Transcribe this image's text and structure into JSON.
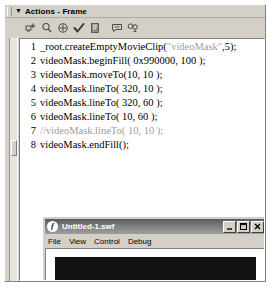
{
  "panel": {
    "title": "Actions - Frame",
    "collapse_arrow": "▼",
    "grip_icon": "drag-grip-icon"
  },
  "toolbar": {
    "buttons": [
      {
        "name": "add-statement-icon",
        "label": "Add a new item to the script"
      },
      {
        "name": "find-icon",
        "label": "Find"
      },
      {
        "name": "insert-target-path-icon",
        "label": "Insert a target path"
      },
      {
        "name": "check-syntax-icon",
        "label": "Check syntax"
      },
      {
        "name": "auto-format-icon",
        "label": "Auto format"
      },
      {
        "name": "show-code-hint-icon",
        "label": "Show code hint"
      },
      {
        "name": "debug-options-icon",
        "label": "Debug options"
      }
    ]
  },
  "code": {
    "lines": [
      {
        "number": "1",
        "bold": false,
        "tokens": [
          {
            "text": "_root.createEmptyMovieClip(",
            "type": "plain"
          },
          {
            "text": "\"videoMask\"",
            "type": "string"
          },
          {
            "text": ",5);",
            "type": "plain"
          }
        ]
      },
      {
        "number": "2",
        "bold": true,
        "tokens": [
          {
            "text": "videoMask.beginFill( 0x990000, 100 );",
            "type": "plain"
          }
        ]
      },
      {
        "number": "3",
        "bold": true,
        "tokens": [
          {
            "text": "videoMask.moveTo(10, 10 );",
            "type": "plain"
          }
        ]
      },
      {
        "number": "4",
        "bold": true,
        "tokens": [
          {
            "text": "videoMask.lineTo( 320, 10 );",
            "type": "plain"
          }
        ]
      },
      {
        "number": "5",
        "bold": true,
        "tokens": [
          {
            "text": "videoMask.lineTo( 320, 60 );",
            "type": "plain"
          }
        ]
      },
      {
        "number": "6",
        "bold": true,
        "tokens": [
          {
            "text": "videoMask.lineTo( 10, 60 );",
            "type": "plain"
          }
        ]
      },
      {
        "number": "7",
        "bold": false,
        "tokens": [
          {
            "text": "//videoMask.lineTo( 10, 10 );",
            "type": "comment"
          }
        ]
      },
      {
        "number": "8",
        "bold": true,
        "tokens": [
          {
            "text": "videoMask.endFill();",
            "type": "plain"
          }
        ]
      }
    ]
  },
  "scrollbar": {
    "name": "code-vertical-scrollbar"
  },
  "swf_window": {
    "title": "Untitled-1.swf",
    "app_icon": "flash-player-icon",
    "app_icon_glyph": "ƒ",
    "window_buttons": [
      {
        "name": "minimize-button",
        "glyph": "minimize"
      },
      {
        "name": "maximize-button",
        "glyph": "maximize"
      },
      {
        "name": "close-button",
        "glyph": "close"
      }
    ],
    "menus": [
      {
        "name": "menu-file",
        "label": "File"
      },
      {
        "name": "menu-view",
        "label": "View"
      },
      {
        "name": "menu-control",
        "label": "Control"
      },
      {
        "name": "menu-debug",
        "label": "Debug"
      }
    ],
    "stage": {
      "background_color": "#ffffff",
      "shape_color": "#111111",
      "shape_name": "video-mask-rectangle"
    }
  }
}
